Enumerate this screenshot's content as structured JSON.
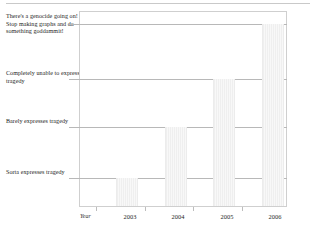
{
  "chart_data": {
    "type": "bar",
    "title": "",
    "subtitle": "",
    "xlabel": "Year",
    "ylabel": "",
    "grid": true,
    "legend": null,
    "categories": [
      "2003",
      "2004",
      "2005",
      "2006"
    ],
    "values": [
      1,
      2,
      3,
      4
    ],
    "ytick_labels": [
      "Sorta expresses tragedy",
      "Barely expresses tragedy",
      "Completely unable to express tragedy",
      "There's a genocide going on! Stop making graphs and do something goddammit!"
    ],
    "ytick_values": [
      1,
      2,
      3,
      4
    ],
    "ylim": [
      0,
      4.3
    ],
    "series": [
      {
        "name": "expressiveness",
        "values": [
          1,
          2,
          3,
          4
        ]
      }
    ],
    "annotations": [],
    "bar_color": "#f4f4f4",
    "grid_color": "#b8b8b8",
    "frame_color": "#cfcfcf"
  },
  "axes": {
    "y_labels": {
      "top": "There's a genocide going on! Stop making graphs and do something goddammit!",
      "completely": "Completely unable to express tragedy",
      "barely": "Barely expresses tragedy",
      "sorta": "Sorta expresses tragedy"
    },
    "x_title": "Year",
    "x_ticks": [
      "2003",
      "2004",
      "2005",
      "2006"
    ]
  }
}
